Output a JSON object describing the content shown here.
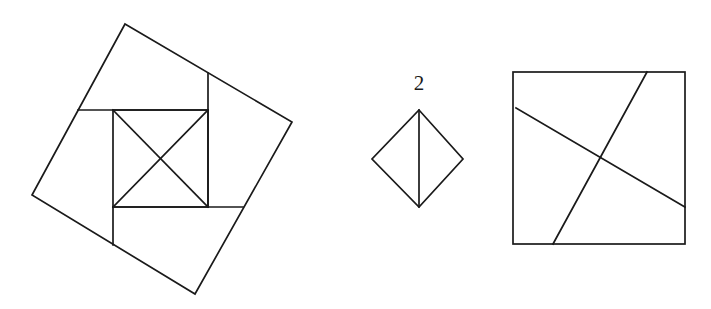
{
  "figure": {
    "background_color": "#ffffff",
    "stroke_color": "#1a1a1a",
    "stroke_width": 1.7,
    "panels": [
      {
        "id": "left-panel",
        "name": "tilted-square-with-inscribed-square",
        "label": "",
        "outer_square": {
          "name": "tilted-outer-square",
          "points": "125,24 292,122 195,294 32,195",
          "rotation_deg": 30
        },
        "inner_square": {
          "name": "inner-axis-aligned-square",
          "x": 113,
          "y": 110,
          "width": 95,
          "height": 97
        },
        "diagonals": [
          {
            "name": "inner-square-diagonal-nw-se",
            "points": "113,110 208,207"
          },
          {
            "name": "inner-square-diagonal-sw-ne",
            "points": "113,207 208,110"
          }
        ],
        "cut_lines": [
          {
            "name": "upper-horizontal-cut",
            "points": "78,110 208,110"
          },
          {
            "name": "right-vertical-cut",
            "points": "208,73 208,207"
          },
          {
            "name": "lower-horizontal-cut",
            "points": "113,207 243,207"
          },
          {
            "name": "left-vertical-cut",
            "points": "113,207 113,245"
          }
        ]
      },
      {
        "id": "middle-panel",
        "name": "labelled-diamond",
        "label": "2",
        "label_x": 419,
        "label_y": 90,
        "diamond": {
          "name": "diamond-square",
          "points": "419,110 463,159 419,207 372,159"
        },
        "cut_lines": [
          {
            "name": "diamond-vertical-bisector",
            "points": "419,110 419,207"
          }
        ]
      },
      {
        "id": "right-panel",
        "name": "square-with-two-crossing-cuts",
        "label": "",
        "square": {
          "name": "axis-aligned-square",
          "x": 513,
          "y": 72,
          "width": 172,
          "height": 172
        },
        "cut_lines": [
          {
            "name": "steep-cut-line",
            "points": "647,72 553,244"
          },
          {
            "name": "shallow-cut-line",
            "points": "516,108 685,207"
          }
        ]
      }
    ]
  }
}
